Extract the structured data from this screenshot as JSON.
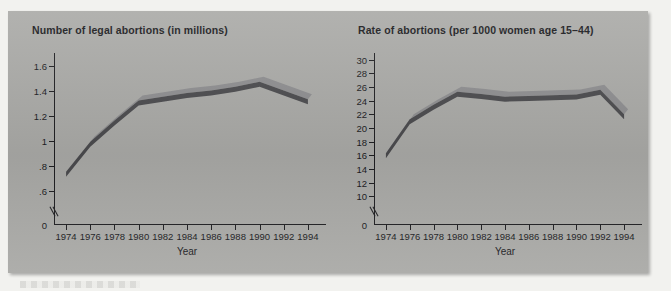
{
  "figure": {
    "background_color": "#a9a9a6",
    "line_face_color": "#4a4a4d",
    "line_top_color": "#8d8d8f"
  },
  "charts": [
    {
      "id": "left",
      "title": "Number of legal abortions (in millions)",
      "xlabel": "Year",
      "ylabel": "",
      "type": "line",
      "x": [
        1974,
        1976,
        1978,
        1980,
        1982,
        1984,
        1986,
        1988,
        1990,
        1992,
        1994
      ],
      "values": [
        0.75,
        0.99,
        1.16,
        1.32,
        1.35,
        1.38,
        1.4,
        1.43,
        1.47,
        1.4,
        1.33
      ],
      "ylim": [
        0.5,
        1.7
      ],
      "yticks": [
        1.6,
        1.4,
        1.2,
        1,
        0.8,
        0.6
      ],
      "ytick_labels": [
        "1.6",
        "1.4",
        "1.2",
        "1",
        ".8",
        ".6"
      ],
      "zero_label": "0",
      "axis_break": true,
      "grid": false,
      "xticks": [
        1974,
        1976,
        1978,
        1980,
        1982,
        1984,
        1986,
        1988,
        1990,
        1992,
        1994
      ],
      "xtick_labels": [
        "1974",
        "1976",
        "1978",
        "1980",
        "1982",
        "1984",
        "1986",
        "1988",
        "1990",
        "1992",
        "1994"
      ]
    },
    {
      "id": "right",
      "title": "Rate of abortions (per 1000 women age 15–44)",
      "xlabel": "Year",
      "ylabel": "",
      "type": "line",
      "x": [
        1974,
        1976,
        1978,
        1980,
        1982,
        1984,
        1986,
        1988,
        1990,
        1992,
        1994
      ],
      "values": [
        16.3,
        21.3,
        23.4,
        25.3,
        25.0,
        24.6,
        24.7,
        24.8,
        24.9,
        25.6,
        22.0
      ],
      "ylim": [
        9,
        31
      ],
      "yticks": [
        30,
        28,
        26,
        24,
        22,
        20,
        18,
        16,
        14,
        12,
        10
      ],
      "ytick_labels": [
        "30",
        "28",
        "26",
        "24",
        "22",
        "20",
        "18",
        "16",
        "14",
        "12",
        "10"
      ],
      "zero_label": "0",
      "axis_break": true,
      "grid": false,
      "xticks": [
        1974,
        1976,
        1978,
        1980,
        1982,
        1984,
        1986,
        1988,
        1990,
        1992,
        1994
      ],
      "xtick_labels": [
        "1974",
        "1976",
        "1978",
        "1980",
        "1982",
        "1984",
        "1986",
        "1988",
        "1990",
        "1992",
        "1994"
      ]
    }
  ],
  "chart_data": [
    {
      "type": "line",
      "title": "Number of legal abortions (in millions)",
      "xlabel": "Year",
      "ylabel": "Number of legal abortions (in millions)",
      "x": [
        1974,
        1976,
        1978,
        1980,
        1982,
        1984,
        1986,
        1988,
        1990,
        1992,
        1994
      ],
      "values": [
        0.75,
        0.99,
        1.16,
        1.32,
        1.35,
        1.38,
        1.4,
        1.43,
        1.47,
        1.4,
        1.33
      ],
      "xlim": [
        1973,
        1995
      ],
      "ylim": [
        0.5,
        1.7
      ],
      "yticks": [
        0.6,
        0.8,
        1.0,
        1.2,
        1.4,
        1.6
      ],
      "ytick_labels": [
        ".6",
        ".8",
        "1",
        "1.2",
        "1.4",
        "1.6"
      ],
      "grid": false,
      "legend": null,
      "annotations": [
        "y-axis break between 0 and .6",
        "axis origin labelled 0"
      ]
    },
    {
      "type": "line",
      "title": "Rate of abortions (per 1000 women age 15–44)",
      "xlabel": "Year",
      "ylabel": "Rate of abortions (per 1000 women age 15–44)",
      "x": [
        1974,
        1976,
        1978,
        1980,
        1982,
        1984,
        1986,
        1988,
        1990,
        1992,
        1994
      ],
      "values": [
        16.3,
        21.3,
        23.4,
        25.3,
        25.0,
        24.6,
        24.7,
        24.8,
        24.9,
        25.6,
        22.0
      ],
      "xlim": [
        1973,
        1995
      ],
      "ylim": [
        9,
        31
      ],
      "yticks": [
        10,
        12,
        14,
        16,
        18,
        20,
        22,
        24,
        26,
        28,
        30
      ],
      "ytick_labels": [
        "10",
        "12",
        "14",
        "16",
        "18",
        "20",
        "22",
        "24",
        "26",
        "28",
        "30"
      ],
      "grid": false,
      "legend": null,
      "annotations": [
        "y-axis break between 0 and 10",
        "axis origin labelled 0"
      ]
    }
  ]
}
